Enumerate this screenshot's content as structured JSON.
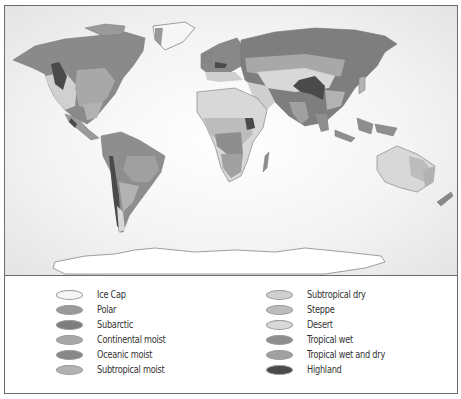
{
  "map": {
    "title": "World climate regions",
    "ocean_color": "#efefef",
    "regions": {
      "ice_cap": "#f6f6f6",
      "polar": "#9a9a9a",
      "subarctic": "#7e7e7e",
      "continental_moist": "#a8a8a8",
      "oceanic_moist": "#888888",
      "subtropical_moist": "#b2b2b2",
      "subtropical_dry": "#cfcfcf",
      "steppe": "#bcbcbc",
      "desert": "#d8d8d8",
      "tropical_wet": "#8e8e8e",
      "tropical_wet_and_dry": "#a0a0a0",
      "highland": "#4a4a4a"
    }
  },
  "legend": {
    "left": [
      {
        "label": "Ice Cap",
        "color": "#f6f6f6"
      },
      {
        "label": "Polar",
        "color": "#9a9a9a"
      },
      {
        "label": "Subarctic",
        "color": "#7e7e7e"
      },
      {
        "label": "Continental moist",
        "color": "#a8a8a8"
      },
      {
        "label": "Oceanic moist",
        "color": "#888888"
      },
      {
        "label": "Subtropical moist",
        "color": "#b2b2b2"
      }
    ],
    "right": [
      {
        "label": "Subtropical dry",
        "color": "#cfcfcf"
      },
      {
        "label": "Steppe",
        "color": "#bcbcbc"
      },
      {
        "label": "Desert",
        "color": "#d8d8d8"
      },
      {
        "label": "Tropical wet",
        "color": "#8e8e8e"
      },
      {
        "label": "Tropical wet and dry",
        "color": "#a0a0a0"
      },
      {
        "label": "Highland",
        "color": "#4a4a4a"
      }
    ]
  }
}
